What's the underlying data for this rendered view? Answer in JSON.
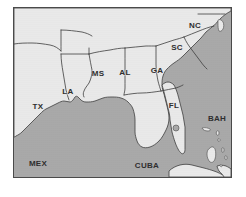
{
  "figure": {
    "type": "reference-map",
    "projection_note": "",
    "frame": {
      "border_color": "#4a4a4a",
      "outer_margin_color": "#ffffff"
    },
    "colors": {
      "land": "#e9e9e9",
      "water": "#a9a9a9",
      "border_line": "#3d3d3d",
      "label_text": "#2e2e2e"
    }
  },
  "labels": {
    "states": [
      {
        "code": "TX",
        "name": "Texas",
        "x": 30,
        "y": 100
      },
      {
        "code": "LA",
        "name": "Louisiana",
        "x": 62,
        "y": 85
      },
      {
        "code": "MS",
        "name": "Mississippi",
        "x": 92,
        "y": 67
      },
      {
        "code": "AL",
        "name": "Alabama",
        "x": 121,
        "y": 66
      },
      {
        "code": "GA",
        "name": "Georgia",
        "x": 152,
        "y": 64
      },
      {
        "code": "FL",
        "name": "Florida",
        "x": 170,
        "y": 98
      },
      {
        "code": "SC",
        "name": "South Carolina",
        "x": 172,
        "y": 42
      },
      {
        "code": "NC",
        "name": "North Carolina",
        "x": 190,
        "y": 20
      }
    ],
    "regions": [
      {
        "code": "MEX",
        "name": "Mexico",
        "x": 31,
        "y": 163
      },
      {
        "code": "CUBA",
        "name": "Cuba",
        "x": 139,
        "y": 165
      },
      {
        "code": "BAH",
        "name": "Bahamas",
        "x": 212,
        "y": 113
      }
    ]
  },
  "features": {
    "water_body": "Gulf of Mexico and western Atlantic Ocean",
    "island_count": 7,
    "lake_count": 1
  }
}
